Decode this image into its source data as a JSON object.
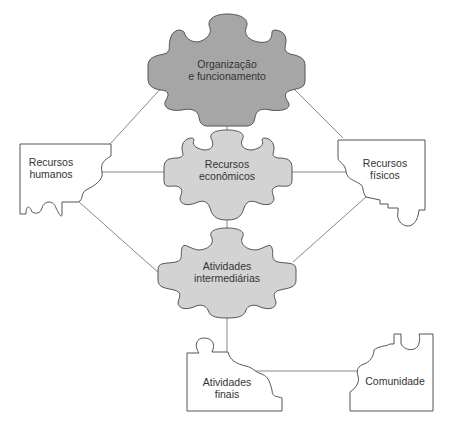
{
  "diagram": {
    "type": "puzzle-concept-map",
    "colors": {
      "center_top_fill": "#a6a6a6",
      "center_fill": "#d3d3d3",
      "side_fill": "#ffffff",
      "stroke": "#555555",
      "connector": "#777777",
      "text": "#333333"
    },
    "nodes": {
      "organizacao": {
        "line1": "Organização",
        "line2": "e funcionamento"
      },
      "recursos_humanos": {
        "line1": "Recursos",
        "line2": "humanos"
      },
      "recursos_economicos": {
        "line1": "Recursos",
        "line2": "econômicos"
      },
      "recursos_fisicos": {
        "line1": "Recursos",
        "line2": "físicos"
      },
      "atividades_intermediarias": {
        "line1": "Atividades",
        "line2": "intermediárias"
      },
      "atividades_finais": {
        "line1": "Atividades",
        "line2": "finais"
      },
      "comunidade": {
        "line1": "Comunidade"
      }
    },
    "edges": [
      [
        "organizacao",
        "recursos_humanos"
      ],
      [
        "organizacao",
        "recursos_fisicos"
      ],
      [
        "organizacao",
        "recursos_economicos"
      ],
      [
        "recursos_humanos",
        "recursos_economicos"
      ],
      [
        "recursos_economicos",
        "recursos_fisicos"
      ],
      [
        "recursos_humanos",
        "atividades_intermediarias"
      ],
      [
        "recursos_fisicos",
        "atividades_intermediarias"
      ],
      [
        "recursos_economicos",
        "atividades_intermediarias"
      ],
      [
        "atividades_intermediarias",
        "atividades_finais"
      ],
      [
        "atividades_finais",
        "comunidade"
      ]
    ]
  }
}
